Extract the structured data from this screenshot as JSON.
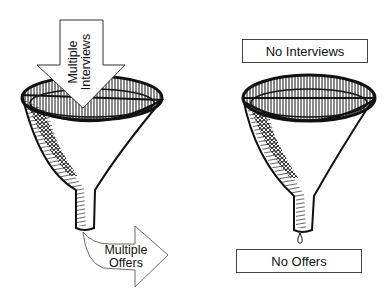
{
  "left_panel": {
    "input_arrow": {
      "line1": "Multiple",
      "line2": "Interviews"
    },
    "output_arrow": {
      "line1": "Multiple",
      "line2": "Offers"
    }
  },
  "right_panel": {
    "top_box": {
      "label": "No Interviews"
    },
    "bottom_box": {
      "label": "No Offers"
    }
  },
  "colors": {
    "ink": "#111111",
    "background": "#ffffff"
  }
}
